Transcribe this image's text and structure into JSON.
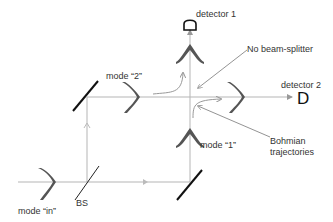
{
  "diagram": {
    "type": "Mach-Zehnder interferometer without final beam splitter",
    "labels": {
      "detector_1": "detector 1",
      "detector_2": "detector 2",
      "detector_2_glyph": "D",
      "no_beam_splitter": "No beam-splitter",
      "mode_2": "mode “2”",
      "mode_1": "mode “1”",
      "mode_in": "mode “in”",
      "bs": "BS",
      "bohmian_line1": "Bohmian",
      "bohmian_line2": "trajectories"
    },
    "colors": {
      "beam": "#b0b0b0",
      "mirror": "#111111",
      "wavepacket": "#555555",
      "arrow": "#888888",
      "text": "#333333"
    }
  }
}
